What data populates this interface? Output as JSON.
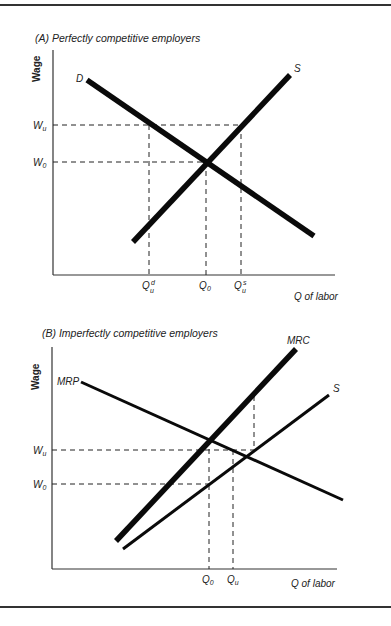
{
  "figure": {
    "panel_a": {
      "title": "(A)  Perfectly competitive employers",
      "y_axis_label": "Wage",
      "x_axis_label": "Q of labor",
      "curves": {
        "demand_label": "D",
        "supply_label": "S"
      },
      "y_ticks": [
        {
          "main": "W",
          "sub": "u"
        },
        {
          "main": "W",
          "sub": "0"
        }
      ],
      "x_ticks": [
        {
          "main": "Q",
          "sub": "u",
          "sup": "d"
        },
        {
          "main": "Q",
          "sub": "0",
          "sup": ""
        },
        {
          "main": "Q",
          "sub": "u",
          "sup": "s"
        }
      ]
    },
    "panel_b": {
      "title": "(B)  Imperfectly competitive employers",
      "y_axis_label": "Wage",
      "x_axis_label": "Q of labor",
      "curves": {
        "mrp_label": "MRP",
        "mrc_label": "MRC",
        "supply_label": "S"
      },
      "y_ticks": [
        {
          "main": "W",
          "sub": "u"
        },
        {
          "main": "W",
          "sub": "0"
        }
      ],
      "x_ticks": [
        {
          "main": "Q",
          "sub": "0"
        },
        {
          "main": "Q",
          "sub": "u"
        }
      ]
    }
  },
  "colors": {
    "line": "#0a0a0a",
    "background": "#ffffff"
  }
}
